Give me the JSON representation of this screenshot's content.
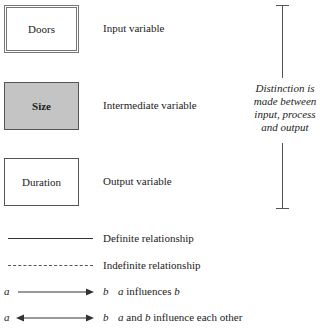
{
  "variables": [
    {
      "name": "Doors",
      "type_label": "Input variable",
      "style": "double-border"
    },
    {
      "name": "Size",
      "type_label": "Intermediate variable",
      "style": "shaded",
      "fill": "#c4c4c4"
    },
    {
      "name": "Duration",
      "type_label": "Output variable",
      "style": "single-border"
    }
  ],
  "bracket": {
    "lines": [
      "Distinction is",
      "made between",
      "input, process",
      "and output"
    ]
  },
  "relationships": [
    {
      "line_style": "solid",
      "label": "Definite relationship"
    },
    {
      "line_style": "dashed",
      "label": "Indefinite relationship"
    }
  ],
  "arrows": [
    {
      "from": "a",
      "to": "b",
      "direction": "one-way",
      "desc_a": "a",
      "desc_mid": " influences ",
      "desc_b": "b"
    },
    {
      "from": "a",
      "to": "b",
      "direction": "two-way",
      "desc_a": "a",
      "desc_mid": " and ",
      "desc_b": "b",
      "desc_tail": " influence each other"
    }
  ]
}
